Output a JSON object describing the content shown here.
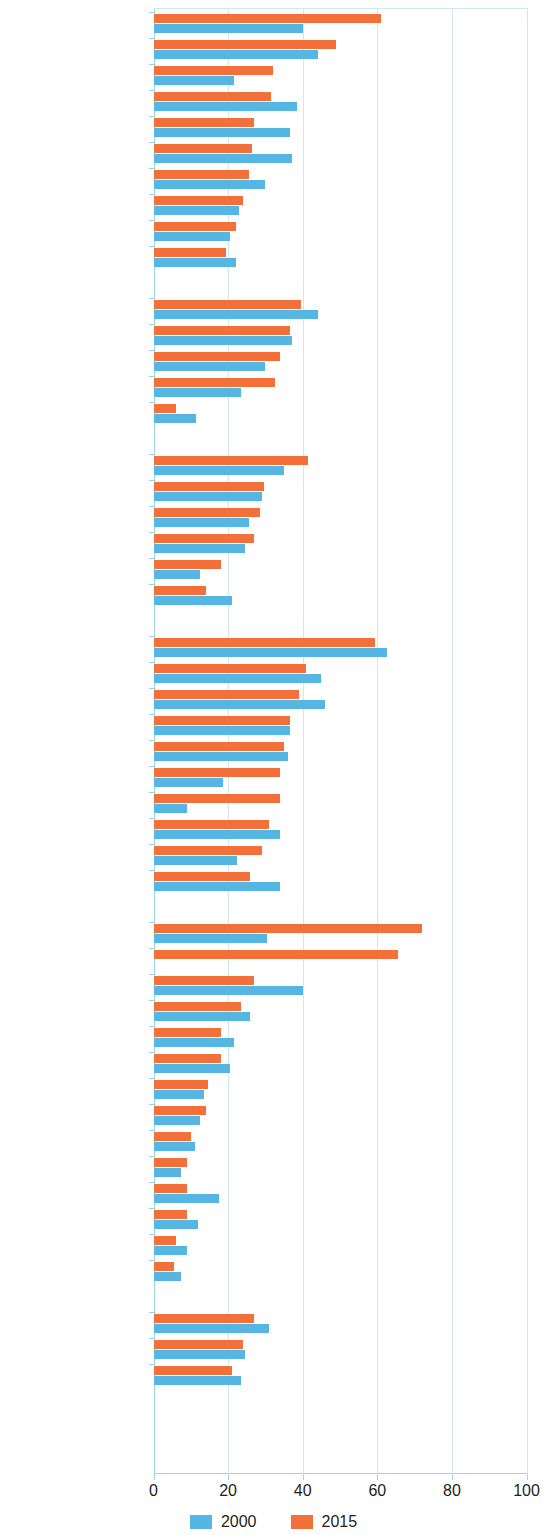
{
  "chart_data": {
    "type": "bar",
    "orientation": "horizontal",
    "title": "",
    "subtitle": "",
    "xlabel": "",
    "ylabel": "",
    "xlim": [
      0,
      100
    ],
    "xticks": [
      0,
      20,
      40,
      60,
      80,
      100
    ],
    "grid": true,
    "legend_position": "bottom-center",
    "series": [
      {
        "name": "2000",
        "color": "#55b6e3"
      },
      {
        "name": "2015",
        "color": "#f4703a"
      }
    ],
    "groups": [
      {
        "name": "Central and West Asia",
        "categories": [
          "Turkmenistan",
          "Azerbaijan",
          "Uzbekistan",
          "Kazakhstan",
          "Armenia",
          "Tajikistan",
          "Kyrgyz Republic",
          "Georgia",
          "Afghanistan",
          "Pakistan"
        ],
        "values_2000": [
          40,
          44,
          21.5,
          38.5,
          36.5,
          37,
          30,
          23,
          20.5,
          22
        ],
        "values_2015": [
          61,
          49,
          32,
          31.5,
          27,
          26.5,
          25.5,
          24,
          22,
          19.5
        ]
      },
      {
        "name": "East Asia",
        "categories": [
          "PRC",
          "Korea, Rep. of",
          "Taipei,China",
          "Mongolia",
          "Hong Kong, China"
        ],
        "values_2000": [
          44,
          37,
          30,
          23.5,
          11.5
        ],
        "values_2015": [
          39.5,
          36.5,
          34,
          32.5,
          6
        ]
      },
      {
        "name": "South Asia",
        "categories": [
          "Bhutan",
          "Sri Lanka",
          "India",
          "Bangladesh",
          "Maldives",
          "Nepal"
        ],
        "values_2000": [
          35,
          29,
          25.5,
          24.5,
          12.5,
          21
        ],
        "values_2015": [
          41.5,
          29.5,
          28.5,
          27,
          18,
          14
        ]
      },
      {
        "name": "Southeast Asia",
        "categories": [
          "Brunei Darussalam",
          "Indonesia",
          "Malaysia",
          "Viet Nam",
          "Thailand",
          "Lao PDR",
          "Myanmar",
          "Philippines",
          "Cambodia",
          "Singapore"
        ],
        "values_2000": [
          62.5,
          45,
          46,
          36.5,
          36,
          18.5,
          9,
          34,
          22.5,
          34
        ],
        "values_2015": [
          59.5,
          41,
          39,
          36.5,
          35,
          34,
          34,
          31,
          29,
          26
        ]
      },
      {
        "name": "The Pacific",
        "categories": [
          "Timor-Leste",
          "Nauru",
          "Papua New Guinea",
          "Samoa",
          "Fiji",
          "Tonga",
          "Solomon Islands",
          "Kiribati",
          "Marshall Islands",
          "Cook Islands",
          "Palau",
          "Vanuatu",
          "FSM",
          "Tuvalu"
        ],
        "values_2000": [
          30.5,
          0,
          40,
          26,
          21.5,
          20.5,
          13.5,
          12.5,
          11,
          7.5,
          17.5,
          12,
          9,
          7.5
        ],
        "values_2015": [
          72,
          65.5,
          27,
          23.5,
          18,
          18,
          14.5,
          14,
          10,
          9,
          9,
          9,
          6,
          5.5
        ]
      },
      {
        "name": "Developed Member Economies",
        "categories": [
          "Japan",
          "Australia",
          "New Zealand"
        ],
        "values_2000": [
          31,
          24.5,
          23.5
        ],
        "values_2015": [
          27,
          24,
          21
        ]
      }
    ]
  },
  "legend": {
    "items": [
      {
        "label": "2000",
        "color": "#55b6e3"
      },
      {
        "label": "2015",
        "color": "#f4703a"
      }
    ]
  },
  "axis": {
    "tick_labels": [
      "0",
      "20",
      "40",
      "60",
      "80",
      "100"
    ]
  }
}
